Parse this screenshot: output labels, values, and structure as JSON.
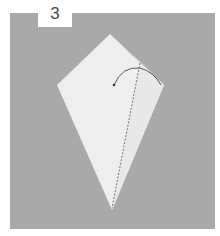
{
  "step": {
    "number": "3"
  },
  "diagram": {
    "elements": [
      "kite-shaped paper",
      "dashed fold line",
      "curved fold arrow"
    ]
  },
  "colors": {
    "background": "#a9a9a9",
    "paper": "#eeeeee",
    "paper_shade": "#e6e6e6",
    "line": "#555555",
    "label_bg": "#ffffff",
    "label_text": "#4a4a4a"
  }
}
